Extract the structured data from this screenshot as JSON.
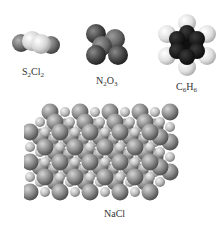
{
  "figure": {
    "molecules": [
      {
        "id": "s2cl2",
        "formula_parts": [
          [
            "S",
            ""
          ],
          [
            "2",
            "sub"
          ],
          [
            "Cl",
            ""
          ],
          [
            "2",
            "sub"
          ]
        ],
        "formula": "S2Cl2"
      },
      {
        "id": "n2o3",
        "formula_parts": [
          [
            "N",
            ""
          ],
          [
            "2",
            "sub"
          ],
          [
            "O",
            ""
          ],
          [
            "3",
            "sub"
          ]
        ],
        "formula": "N2O3"
      },
      {
        "id": "c6h6",
        "formula_parts": [
          [
            "C",
            ""
          ],
          [
            "6",
            "sub"
          ],
          [
            "H",
            ""
          ],
          [
            "6",
            "sub"
          ]
        ],
        "formula": "C6H6"
      },
      {
        "id": "nacl",
        "formula_parts": [
          [
            "NaCl",
            ""
          ]
        ],
        "formula": "NaCl"
      }
    ],
    "colors": {
      "chlorine": "#6e6e6e",
      "sulfur": "#d8d8d8",
      "nitrogen": "#6a6a6a",
      "oxygen": "#3e3e3e",
      "carbon": "#1a1a1a",
      "hydrogen": "#e2e2e2",
      "sodium_ion": "#cfcfcf",
      "chloride_ion": "#8c8c8c"
    }
  }
}
